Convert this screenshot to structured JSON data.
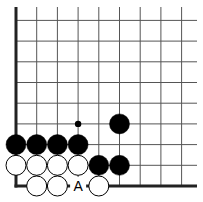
{
  "diagram": {
    "board": {
      "origin_x": 16,
      "origin_y": 186,
      "spacing": 20.7,
      "columns": 9,
      "rows": 9,
      "line_color": "#555555",
      "edge_color": "#222222"
    },
    "stones": [
      {
        "color": "black",
        "col": 0,
        "row": 2
      },
      {
        "color": "black",
        "col": 1,
        "row": 2
      },
      {
        "color": "black",
        "col": 2,
        "row": 2
      },
      {
        "color": "black",
        "col": 3,
        "row": 2
      },
      {
        "color": "black",
        "col": 5,
        "row": 3
      },
      {
        "color": "black",
        "col": 4,
        "row": 1
      },
      {
        "color": "black",
        "col": 5,
        "row": 1
      },
      {
        "color": "white",
        "col": 0,
        "row": 1
      },
      {
        "color": "white",
        "col": 1,
        "row": 1
      },
      {
        "color": "white",
        "col": 2,
        "row": 1
      },
      {
        "color": "white",
        "col": 3,
        "row": 1
      },
      {
        "color": "white",
        "col": 1,
        "row": 0
      },
      {
        "color": "white",
        "col": 2,
        "row": 0
      },
      {
        "color": "white",
        "col": 4,
        "row": 0
      }
    ],
    "markers": [
      {
        "type": "dot",
        "col": 3,
        "row": 3
      }
    ],
    "labels": [
      {
        "text": "A",
        "col": 3,
        "row": 0
      }
    ]
  }
}
